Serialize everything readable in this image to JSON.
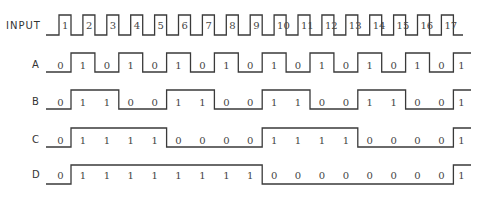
{
  "diagram": {
    "type": "timing-diagram",
    "input": {
      "label": "INPUT",
      "pulses": [
        "1",
        "2",
        "3",
        "4",
        "5",
        "6",
        "7",
        "8",
        "9",
        "10",
        "11",
        "12",
        "13",
        "14",
        "15",
        "16",
        "17"
      ]
    },
    "signals": [
      {
        "label": "A",
        "values": [
          0,
          1,
          0,
          1,
          0,
          1,
          0,
          1,
          0,
          1,
          0,
          1,
          0,
          1,
          0,
          1,
          0,
          1
        ]
      },
      {
        "label": "B",
        "values": [
          0,
          1,
          1,
          0,
          0,
          1,
          1,
          0,
          0,
          1,
          1,
          0,
          0,
          1,
          1,
          0,
          0,
          1
        ]
      },
      {
        "label": "C",
        "values": [
          0,
          1,
          1,
          1,
          1,
          0,
          0,
          0,
          0,
          1,
          1,
          1,
          1,
          0,
          0,
          0,
          0,
          1
        ]
      },
      {
        "label": "D",
        "values": [
          0,
          1,
          1,
          1,
          1,
          1,
          1,
          1,
          1,
          0,
          0,
          0,
          0,
          0,
          0,
          0,
          0,
          1
        ]
      }
    ]
  }
}
